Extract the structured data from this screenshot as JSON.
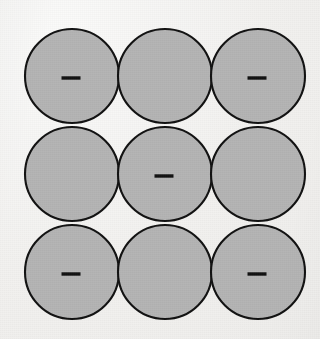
{
  "figure": {
    "background_color": "#f1f0ee",
    "canvas": {
      "width": 320,
      "height": 339
    }
  },
  "lattice": {
    "rows": 3,
    "columns": 3,
    "circle": {
      "radius": 47,
      "fill_color": "#b4b4b4",
      "stroke_color": "#111111",
      "stroke_width": 2.1
    },
    "origin": {
      "x": 72,
      "y": 76
    },
    "spacing": {
      "x": 93,
      "y": 98
    },
    "charge_symbol": {
      "label": "-",
      "name": "minus-sign",
      "color": "#111111",
      "length": 19,
      "thickness": 3.4,
      "offset": {
        "x": -1,
        "y": 2
      }
    },
    "items": [
      {
        "id": "sphere-r1c1",
        "row": 1,
        "col": 1,
        "cx": 72,
        "cy": 76,
        "charge": "-"
      },
      {
        "id": "sphere-r1c2",
        "row": 1,
        "col": 2,
        "cx": 165,
        "cy": 76,
        "charge": ""
      },
      {
        "id": "sphere-r1c3",
        "row": 1,
        "col": 3,
        "cx": 258,
        "cy": 76,
        "charge": "-"
      },
      {
        "id": "sphere-r2c1",
        "row": 2,
        "col": 1,
        "cx": 72,
        "cy": 174,
        "charge": ""
      },
      {
        "id": "sphere-r2c2",
        "row": 2,
        "col": 2,
        "cx": 165,
        "cy": 174,
        "charge": "-"
      },
      {
        "id": "sphere-r2c3",
        "row": 2,
        "col": 3,
        "cx": 258,
        "cy": 174,
        "charge": ""
      },
      {
        "id": "sphere-r3c1",
        "row": 3,
        "col": 1,
        "cx": 72,
        "cy": 272,
        "charge": "-"
      },
      {
        "id": "sphere-r3c2",
        "row": 3,
        "col": 2,
        "cx": 165,
        "cy": 272,
        "charge": ""
      },
      {
        "id": "sphere-r3c3",
        "row": 3,
        "col": 3,
        "cx": 258,
        "cy": 272,
        "charge": "-"
      }
    ]
  }
}
